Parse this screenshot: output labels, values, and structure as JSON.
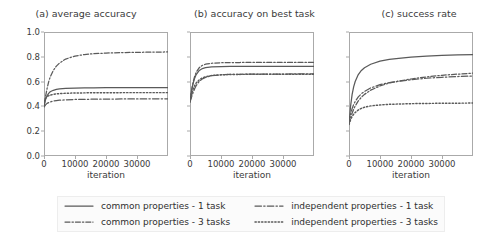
{
  "figure": {
    "xlabel": "iteration"
  },
  "legend": {
    "entries": [
      {
        "label": "common properties - 1 task",
        "style": "solid",
        "key": "common_1"
      },
      {
        "label": "common properties - 3 tasks",
        "style": "dashdot",
        "key": "common_3"
      },
      {
        "label": "independent properties - 1 task",
        "style": "dashdot-long",
        "key": "indep_1"
      },
      {
        "label": "independent properties - 3 tasks",
        "style": "dotted",
        "key": "indep_3"
      }
    ]
  },
  "axes": {
    "yticks": [
      "0.0",
      "0.2",
      "0.4",
      "0.6",
      "0.8",
      "1.0"
    ],
    "ytick_values": [
      0.0,
      0.2,
      0.4,
      0.6,
      0.8,
      1.0
    ],
    "xticks": [
      "0",
      "10000",
      "20000",
      "30000"
    ],
    "xtick_values": [
      0,
      10000,
      20000,
      30000
    ],
    "xlim": [
      0,
      40000
    ],
    "ylim": [
      0.0,
      1.0
    ]
  },
  "chart_data": [
    {
      "type": "line",
      "panel": "a",
      "title": "(a) average accuracy",
      "xlabel": "iteration",
      "ylabel": "",
      "xlim": [
        0,
        40000
      ],
      "ylim": [
        0.0,
        1.0
      ],
      "grid": false,
      "legend_position": "below-figure",
      "x": [
        0,
        500,
        1000,
        1500,
        2000,
        3000,
        4000,
        5000,
        7000,
        10000,
        13000,
        16000,
        20000,
        25000,
        30000,
        35000,
        40000
      ],
      "series": [
        {
          "name": "common properties - 1 task",
          "style": "solid",
          "values": [
            0.4,
            0.455,
            0.485,
            0.505,
            0.518,
            0.53,
            0.537,
            0.541,
            0.545,
            0.548,
            0.549,
            0.55,
            0.551,
            0.551,
            0.552,
            0.552,
            0.552
          ]
        },
        {
          "name": "common properties - 3 tasks",
          "style": "dashdot",
          "values": [
            0.4,
            0.48,
            0.545,
            0.598,
            0.637,
            0.69,
            0.725,
            0.75,
            0.782,
            0.806,
            0.818,
            0.825,
            0.83,
            0.834,
            0.836,
            0.838,
            0.839
          ]
        },
        {
          "name": "independent properties - 1 task",
          "style": "dashdot-long",
          "values": [
            0.395,
            0.412,
            0.424,
            0.431,
            0.436,
            0.443,
            0.447,
            0.45,
            0.453,
            0.456,
            0.457,
            0.458,
            0.459,
            0.46,
            0.46,
            0.461,
            0.461
          ]
        },
        {
          "name": "independent properties - 3 tasks",
          "style": "dotted",
          "values": [
            0.44,
            0.465,
            0.478,
            0.486,
            0.491,
            0.497,
            0.501,
            0.503,
            0.506,
            0.508,
            0.509,
            0.51,
            0.51,
            0.511,
            0.511,
            0.511,
            0.511
          ]
        }
      ]
    },
    {
      "type": "line",
      "panel": "b",
      "title": "(b) accuracy on best task",
      "xlabel": "iteration",
      "ylabel": "",
      "xlim": [
        0,
        40000
      ],
      "ylim": [
        0.0,
        1.0
      ],
      "grid": false,
      "legend_position": "below-figure",
      "x": [
        0,
        500,
        1000,
        1500,
        2000,
        3000,
        4000,
        5000,
        7000,
        10000,
        13000,
        16000,
        20000,
        25000,
        30000,
        35000,
        40000
      ],
      "series": [
        {
          "name": "common properties - 1 task",
          "style": "solid",
          "values": [
            0.44,
            0.525,
            0.585,
            0.628,
            0.657,
            0.69,
            0.705,
            0.712,
            0.718,
            0.721,
            0.722,
            0.722,
            0.723,
            0.723,
            0.723,
            0.723,
            0.723
          ]
        },
        {
          "name": "common properties - 3 tasks",
          "style": "dashdot",
          "values": [
            0.44,
            0.53,
            0.595,
            0.642,
            0.675,
            0.713,
            0.731,
            0.74,
            0.748,
            0.752,
            0.754,
            0.754,
            0.755,
            0.755,
            0.755,
            0.755,
            0.755
          ]
        },
        {
          "name": "independent properties - 1 task",
          "style": "dashdot-long",
          "values": [
            0.435,
            0.475,
            0.512,
            0.543,
            0.568,
            0.602,
            0.622,
            0.634,
            0.648,
            0.655,
            0.658,
            0.659,
            0.66,
            0.661,
            0.661,
            0.662,
            0.662
          ]
        },
        {
          "name": "independent properties - 3 tasks",
          "style": "dotted",
          "values": [
            0.435,
            0.495,
            0.538,
            0.568,
            0.589,
            0.615,
            0.63,
            0.639,
            0.649,
            0.655,
            0.657,
            0.658,
            0.659,
            0.66,
            0.66,
            0.66,
            0.66
          ]
        }
      ]
    },
    {
      "type": "line",
      "panel": "c",
      "title": "(c) success rate",
      "xlabel": "iteration",
      "ylabel": "",
      "xlim": [
        0,
        40000
      ],
      "ylim": [
        0.0,
        1.0
      ],
      "grid": false,
      "legend_position": "below-figure",
      "x": [
        0,
        500,
        1000,
        1500,
        2000,
        3000,
        4000,
        5000,
        7000,
        10000,
        13000,
        16000,
        20000,
        25000,
        30000,
        35000,
        40000
      ],
      "series": [
        {
          "name": "common properties - 1 task",
          "style": "solid",
          "values": [
            0.26,
            0.4,
            0.495,
            0.557,
            0.601,
            0.657,
            0.69,
            0.712,
            0.74,
            0.765,
            0.779,
            0.788,
            0.797,
            0.805,
            0.811,
            0.815,
            0.818
          ]
        },
        {
          "name": "common properties - 3 tasks",
          "style": "dashdot",
          "values": [
            0.255,
            0.305,
            0.345,
            0.377,
            0.403,
            0.444,
            0.474,
            0.497,
            0.531,
            0.565,
            0.588,
            0.604,
            0.621,
            0.638,
            0.651,
            0.66,
            0.668
          ]
        },
        {
          "name": "independent properties - 1 task",
          "style": "dashdot-long",
          "values": [
            0.265,
            0.335,
            0.382,
            0.415,
            0.44,
            0.477,
            0.502,
            0.521,
            0.549,
            0.575,
            0.592,
            0.603,
            0.615,
            0.627,
            0.635,
            0.641,
            0.645
          ]
        },
        {
          "name": "independent properties - 3 tasks",
          "style": "dotted",
          "values": [
            0.255,
            0.292,
            0.318,
            0.337,
            0.351,
            0.371,
            0.384,
            0.393,
            0.404,
            0.412,
            0.417,
            0.419,
            0.422,
            0.424,
            0.425,
            0.426,
            0.427
          ]
        }
      ]
    }
  ]
}
